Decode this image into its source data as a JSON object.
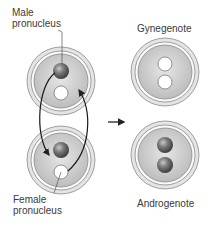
{
  "labels": {
    "male_line1": "Male",
    "male_line2": "pronucleus",
    "female_line1": "Female",
    "female_line2": "pronucleus",
    "gynegenote": "Gynegenote",
    "androgenote": "Androgenote"
  },
  "colors": {
    "zona": "#d9d9d9",
    "cytoplasm": "#c8c8c8",
    "male_pronucleus": "#6e6e6e",
    "female_pronucleus": "#ffffff",
    "outline": "#7a7a7a",
    "arrow": "#222222"
  },
  "eggs": [
    {
      "name": "zygote-top",
      "cx": 61,
      "cy": 81,
      "nuclei": [
        "male",
        "female"
      ]
    },
    {
      "name": "zygote-bottom",
      "cx": 61,
      "cy": 160,
      "nuclei": [
        "male",
        "female"
      ]
    },
    {
      "name": "gynegenote",
      "cx": 165,
      "cy": 72,
      "nuclei": [
        "female",
        "female"
      ]
    },
    {
      "name": "androgenote",
      "cx": 165,
      "cy": 155,
      "nuclei": [
        "male",
        "male"
      ]
    }
  ]
}
